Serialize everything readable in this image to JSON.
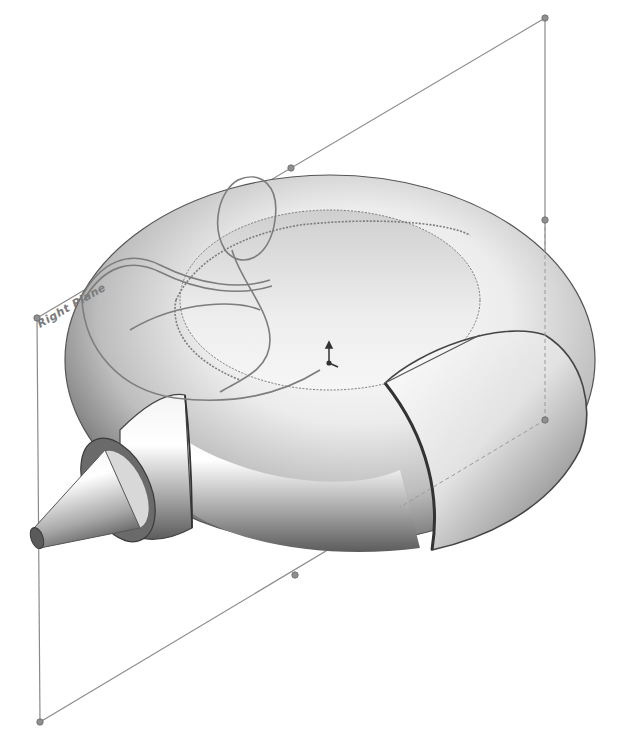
{
  "scene": {
    "type": "cad-3d-model-view",
    "description": "Shaded torus body with conical nozzle, sweep path sketch curves and Right Plane reference",
    "background": "#ffffff"
  },
  "reference_plane": {
    "label": "Right Plane",
    "corners": [
      [
        37,
        318
      ],
      [
        545,
        18
      ],
      [
        545,
        420
      ],
      [
        40,
        722
      ]
    ],
    "handles": [
      [
        37,
        318
      ],
      [
        545,
        18
      ],
      [
        291,
        168
      ],
      [
        545,
        220
      ],
      [
        545,
        420
      ],
      [
        295,
        575
      ],
      [
        40,
        722
      ],
      [
        38,
        520
      ]
    ],
    "line_color": "#8a8a8a"
  },
  "model": {
    "body": "torus",
    "features": [
      "torus-ring",
      "cylindrical-sweep-segment",
      "cone-nozzle",
      "nozzle-flange",
      "split-cut"
    ],
    "shade_light": "#ffffff",
    "shade_mid": "#c9c9c9",
    "shade_dark": "#5a5a5a",
    "edge_color": "#4a4a4a"
  },
  "sketch": {
    "curves": [
      "helical-sweep-path",
      "inner-ellipse-dashed"
    ],
    "curve_color": "#7d7d7d"
  },
  "origin_triad": {
    "position": [
      329,
      354
    ],
    "icon": "coordinate-triad-icon"
  }
}
